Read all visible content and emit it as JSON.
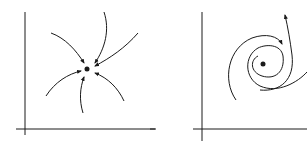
{
  "diagram": {
    "panels": [
      {
        "name": "stable-node",
        "description": "Trajectories converging to an equilibrium point",
        "arrow_direction": "inward"
      },
      {
        "name": "spiral",
        "description": "Spiral trajectories around an equilibrium point",
        "arrow_direction": "outward"
      }
    ],
    "colors": {
      "stroke": "#1a1a1a",
      "background": "#ffffff"
    }
  }
}
